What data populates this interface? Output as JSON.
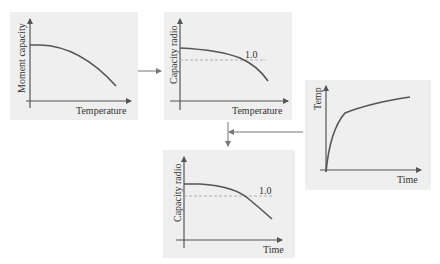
{
  "diagram": {
    "panels": [
      {
        "id": "moment-vs-temperature",
        "ylabel": "Moment capacity",
        "xlabel": "Temperature",
        "reference": null
      },
      {
        "id": "ratio-vs-temperature",
        "ylabel": "Capacity radio",
        "xlabel": "Temperature",
        "reference": "1.0"
      },
      {
        "id": "temp-vs-time",
        "ylabel": "Temp",
        "xlabel": "Time",
        "reference": null
      },
      {
        "id": "ratio-vs-time",
        "ylabel": "Capacity radio",
        "xlabel": "Time",
        "reference": "1.0"
      }
    ],
    "flow": [
      "moment-vs-temperature -> ratio-vs-temperature",
      "ratio-vs-temperature + temp-vs-time -> ratio-vs-time"
    ],
    "colors": {
      "panel_bg": "#efefef",
      "curve": "#555555",
      "axis": "#555555",
      "dashed": "#aaaaaa",
      "arrow": "#777777"
    }
  }
}
